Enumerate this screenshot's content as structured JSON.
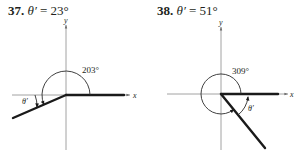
{
  "problems": [
    {
      "number": "37.",
      "theta_symbol": "θ′",
      "equals": "=",
      "reference_angle": "23°",
      "angle_label": "203°",
      "x_axis_label": "x",
      "y_axis_label": "y",
      "ref_label": "θ′"
    },
    {
      "number": "38.",
      "theta_symbol": "θ′",
      "equals": "=",
      "reference_angle": "51°",
      "angle_label": "309°",
      "x_axis_label": "x",
      "y_axis_label": "y",
      "ref_label": "θ′"
    }
  ]
}
